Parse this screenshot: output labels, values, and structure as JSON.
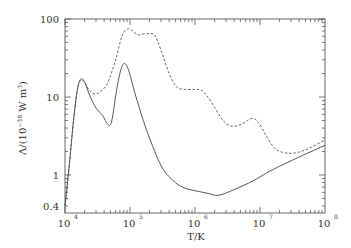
{
  "chart_data": {
    "type": "line",
    "title": "",
    "xlabel": "T/K",
    "ylabel": "Λ/(10⁻³⁸ W m³)",
    "xscale": "log",
    "yscale": "log",
    "xlim": [
      10000,
      100000000
    ],
    "ylim": [
      0.33,
      100
    ],
    "x_ticks": [
      {
        "base": "10",
        "exp": "4"
      },
      {
        "base": "10",
        "exp": "5"
      },
      {
        "base": "10",
        "exp": "6"
      },
      {
        "base": "10",
        "exp": "7"
      },
      {
        "base": "10",
        "exp": "8"
      }
    ],
    "y_ticks": [
      "100",
      "10",
      "1",
      "0.4"
    ],
    "grid": false,
    "legend": null,
    "series": [
      {
        "name": "solid",
        "style": "solid",
        "points": [
          [
            10000,
            0.4
          ],
          [
            11500,
            1.2
          ],
          [
            13500,
            5.0
          ],
          [
            15500,
            12.5
          ],
          [
            17500,
            17.0
          ],
          [
            20000,
            15.5
          ],
          [
            24000,
            10.5
          ],
          [
            30000,
            7.2
          ],
          [
            38000,
            5.8
          ],
          [
            45000,
            4.5
          ],
          [
            52000,
            4.8
          ],
          [
            62000,
            12.0
          ],
          [
            72000,
            22.0
          ],
          [
            82000,
            27.0
          ],
          [
            95000,
            22.0
          ],
          [
            120000,
            11.0
          ],
          [
            160000,
            5.0
          ],
          [
            220000,
            2.4
          ],
          [
            320000,
            1.2
          ],
          [
            500000,
            0.8
          ],
          [
            700000,
            0.68
          ],
          [
            1000000,
            0.63
          ],
          [
            1600000,
            0.58
          ],
          [
            2300000,
            0.55
          ],
          [
            4000000,
            0.65
          ],
          [
            8000000,
            0.85
          ],
          [
            15000000,
            1.15
          ],
          [
            40000000,
            1.7
          ],
          [
            100000000,
            2.4
          ]
        ]
      },
      {
        "name": "dashed",
        "style": "dashed",
        "points": [
          [
            10000,
            0.4
          ],
          [
            11500,
            1.2
          ],
          [
            13500,
            5.0
          ],
          [
            15500,
            12.5
          ],
          [
            17500,
            16.5
          ],
          [
            20000,
            15.5
          ],
          [
            24000,
            12.0
          ],
          [
            28000,
            11.0
          ],
          [
            34000,
            11.5
          ],
          [
            45000,
            15.0
          ],
          [
            60000,
            30.0
          ],
          [
            75000,
            60.0
          ],
          [
            90000,
            74.0
          ],
          [
            105000,
            72.0
          ],
          [
            130000,
            63.0
          ],
          [
            160000,
            64.0
          ],
          [
            200000,
            65.0
          ],
          [
            240000,
            62.0
          ],
          [
            300000,
            40.0
          ],
          [
            400000,
            20.0
          ],
          [
            520000,
            13.5
          ],
          [
            700000,
            12.5
          ],
          [
            1000000,
            12.5
          ],
          [
            1300000,
            12.0
          ],
          [
            1800000,
            8.5
          ],
          [
            2700000,
            5.0
          ],
          [
            3800000,
            4.2
          ],
          [
            5500000,
            4.6
          ],
          [
            7500000,
            5.3
          ],
          [
            9500000,
            4.7
          ],
          [
            13000000,
            3.0
          ],
          [
            18000000,
            2.1
          ],
          [
            30000000,
            1.9
          ],
          [
            50000000,
            2.1
          ],
          [
            100000000,
            2.8
          ]
        ]
      }
    ]
  },
  "plot": {
    "left": 65,
    "right": 325,
    "top": 19,
    "bottom": 213,
    "y_decade_px": 78,
    "y_one_px": 175
  }
}
